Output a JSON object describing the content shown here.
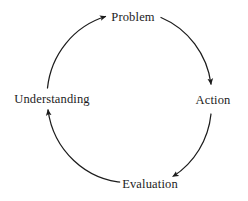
{
  "diagram": {
    "type": "cycle",
    "direction": "clockwise",
    "background_color": "#ffffff",
    "stroke_color": "#1c1c1c",
    "text_color": "#1c1c1c",
    "nodes": [
      {
        "id": "problem",
        "label": "Problem",
        "position": "top"
      },
      {
        "id": "action",
        "label": "Action",
        "position": "right"
      },
      {
        "id": "evaluation",
        "label": "Evaluation",
        "position": "bottom"
      },
      {
        "id": "understanding",
        "label": "Understanding",
        "position": "left"
      }
    ],
    "edges": [
      {
        "from": "understanding",
        "to": "problem",
        "arrow": "end"
      },
      {
        "from": "problem",
        "to": "action",
        "arrow": "end"
      },
      {
        "from": "action",
        "to": "evaluation",
        "arrow": "end"
      },
      {
        "from": "evaluation",
        "to": "understanding",
        "arrow": "end"
      }
    ]
  }
}
